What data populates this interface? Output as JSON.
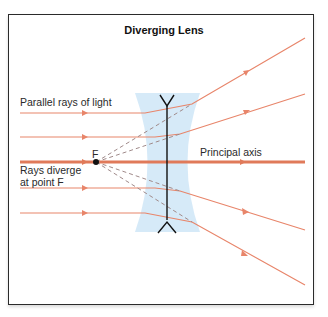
{
  "diagram": {
    "title": "Diverging Lens",
    "labels": {
      "parallel_rays": "Parallel rays of light",
      "principal_axis": "Principal axis",
      "diverge_line1": "Rays diverge",
      "diverge_line2": "at point F",
      "focal_point": "F"
    },
    "colors": {
      "ray": "#e8856a",
      "axis": "#e07a5a",
      "lens_fill": "#cfe6f7",
      "virtual_ray": "#a08a8a",
      "lens_symbol": "#111111",
      "frame": "#2b2b2b"
    },
    "elements": {
      "lens": "diverging (concave) lens",
      "incoming_rays": 4,
      "focal_point_marker": "black dot"
    }
  }
}
